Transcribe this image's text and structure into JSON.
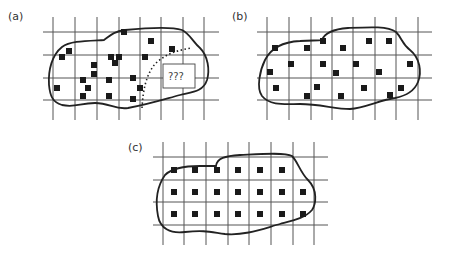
{
  "panels": {
    "a": {
      "label": "(a)",
      "unknown_region_label": "???",
      "description": "Irregular region over grid with randomly scattered samples; dotted boundary separates an unsampled area containing a box marked ???"
    },
    "b": {
      "label": "(b)",
      "description": "Irregular region over grid with samples spread more evenly at random"
    },
    "c": {
      "label": "(c)",
      "description": "Irregular region over grid with samples placed systematically at cell centers"
    }
  }
}
